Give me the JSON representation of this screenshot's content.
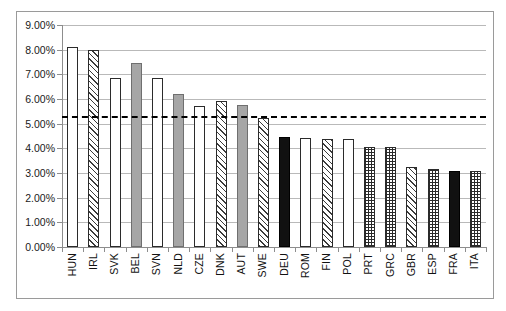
{
  "chart_data": {
    "type": "bar",
    "title": "",
    "subtitle": "",
    "xlabel": "",
    "ylabel": "",
    "ylim": [
      0,
      9
    ],
    "ytick_labels": [
      "9.00%",
      "8.00%",
      "7.00%",
      "6.00%",
      "5.00%",
      "4.00%",
      "3.00%",
      "2.00%",
      "1.00%",
      "0.00%"
    ],
    "ytick_values": [
      9,
      8,
      7,
      6,
      5,
      4,
      3,
      2,
      1,
      0
    ],
    "grid": true,
    "legend": "none",
    "categories": [
      "HUN",
      "IRL",
      "SVK",
      "BEL",
      "SVN",
      "NLD",
      "CZE",
      "DNK",
      "AUT",
      "SWE",
      "DEU",
      "ROM",
      "FIN",
      "POL",
      "PRT",
      "GRC",
      "GBR",
      "ESP",
      "FRA",
      "ITA"
    ],
    "values": [
      8.1,
      8.0,
      6.85,
      7.45,
      6.85,
      6.22,
      5.72,
      5.92,
      5.75,
      5.22,
      4.48,
      4.42,
      4.38,
      4.38,
      4.05,
      4.05,
      3.25,
      3.18,
      3.1,
      3.1
    ],
    "value_labels": [
      "8.10%",
      "8.00%",
      "6.85%",
      "7.45%",
      "6.85%",
      "6.22%",
      "5.72%",
      "5.92%",
      "5.75%",
      "5.22%",
      "4.48%",
      "4.42%",
      "4.38%",
      "4.38%",
      "4.05%",
      "4.05%",
      "3.25%",
      "3.18%",
      "3.10%",
      "3.10%"
    ],
    "bar_patterns": [
      "open",
      "hatch",
      "open",
      "gray",
      "open",
      "gray",
      "open",
      "hatch",
      "gray",
      "hatch",
      "black",
      "open",
      "hatch",
      "open",
      "dots",
      "dots",
      "hatch",
      "dots",
      "black",
      "dots"
    ],
    "reference_line": {
      "value": 5.3,
      "label": "5.30%",
      "style": "dashed",
      "color": "#000000"
    },
    "colors": {
      "open": "#ffffff",
      "gray": "#a6a6a6",
      "black": "#111111",
      "hatch": "#3b3b3b",
      "dots": "#2a2a2a",
      "gridline": "#b9b9b9",
      "axis": "#8d8d8d",
      "border": "#9a9a9a",
      "text": "#111111"
    }
  }
}
